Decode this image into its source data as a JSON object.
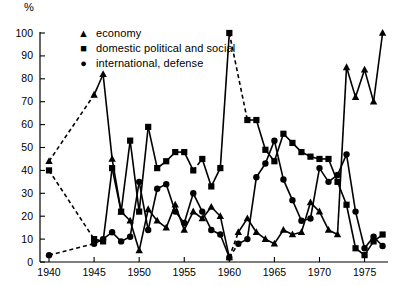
{
  "chart_data": {
    "type": "line",
    "title": "",
    "xlabel": "",
    "ylabel": "%",
    "ylim": [
      0,
      100
    ],
    "xlim": [
      1939,
      1977.6
    ],
    "grid": false,
    "legend_position": "top-left",
    "ytick_labels": [
      "0",
      "10",
      "20",
      "30",
      "40",
      "50",
      "60",
      "70",
      "80",
      "90",
      "100"
    ],
    "ytick_values": [
      0,
      10,
      20,
      30,
      40,
      50,
      60,
      70,
      80,
      90,
      100
    ],
    "xtick_labels": [
      "1940",
      "1945",
      "1950",
      "1955",
      "1960",
      "1965",
      "1970",
      "1975"
    ],
    "xtick_values": [
      1940,
      1945,
      1950,
      1955,
      1960,
      1965,
      1970,
      1975
    ],
    "series": [
      {
        "name": "economy",
        "marker": "triangle",
        "marker_glyph": "▲",
        "color": "#000000",
        "x": [
          1940,
          1945,
          1946,
          1947,
          1948,
          1949,
          1950,
          1951,
          1952,
          1953,
          1954,
          1955,
          1956,
          1957,
          1958,
          1959,
          1960,
          1961,
          1962,
          1963,
          1964,
          1965,
          1966,
          1967,
          1968,
          1969,
          1970,
          1971,
          1972,
          1973,
          1974,
          1975,
          1976,
          1977
        ],
        "y": [
          44,
          73,
          82,
          45,
          22,
          18,
          5,
          23,
          18,
          15,
          25,
          14,
          22,
          19,
          24,
          20,
          2,
          13,
          19,
          13,
          10,
          8,
          14,
          12,
          13,
          26,
          22,
          14,
          12,
          85,
          72,
          84,
          70,
          100
        ],
        "dashed_segments": [
          [
            1940,
            1945
          ],
          [
            1960,
            1961
          ]
        ]
      },
      {
        "name": "domestic political and social",
        "marker": "square",
        "marker_glyph": "■",
        "color": "#000000",
        "x": [
          1940,
          1945,
          1946,
          1947,
          1948,
          1949,
          1950,
          1951,
          1952,
          1953,
          1954,
          1955,
          1956,
          1957,
          1958,
          1959,
          1960,
          1962,
          1963,
          1964,
          1965,
          1966,
          1967,
          1968,
          1969,
          1970,
          1971,
          1972,
          1973,
          1974,
          1975,
          1976,
          1977
        ],
        "y": [
          40,
          10,
          9,
          41,
          22,
          53,
          22,
          59,
          41,
          44,
          48,
          48,
          40,
          45,
          33,
          41,
          100,
          62,
          62,
          49,
          44,
          56,
          52,
          48,
          46,
          45,
          45,
          35,
          25,
          6,
          3,
          9,
          12
        ],
        "dashed_segments": [
          [
            1940,
            1945
          ],
          [
            1956,
            1957
          ],
          [
            1960,
            1962
          ]
        ]
      },
      {
        "name": "international, defense",
        "marker": "circle",
        "marker_glyph": "●",
        "color": "#000000",
        "x": [
          1940,
          1945,
          1946,
          1947,
          1948,
          1949,
          1950,
          1951,
          1952,
          1953,
          1954,
          1955,
          1956,
          1957,
          1958,
          1959,
          1960,
          1961,
          1962,
          1963,
          1964,
          1965,
          1966,
          1967,
          1968,
          1969,
          1970,
          1971,
          1972,
          1973,
          1974,
          1975,
          1976,
          1977
        ],
        "y": [
          3,
          8,
          10,
          13,
          9,
          11,
          35,
          14,
          32,
          34,
          22,
          17,
          30,
          22,
          14,
          12,
          2,
          8,
          10,
          37,
          43,
          53,
          36,
          27,
          18,
          19,
          41,
          35,
          38,
          47,
          22,
          6,
          11,
          7
        ],
        "dashed_segments": [
          [
            1940,
            1945
          ],
          [
            1960,
            1961
          ]
        ]
      }
    ]
  },
  "axis": {
    "unit_label": "%"
  },
  "legend": {
    "items": [
      {
        "marker": "▲",
        "label": "economy",
        "icon": "triangle-marker-icon"
      },
      {
        "marker": "■",
        "label": "domestic political and social",
        "icon": "square-marker-icon"
      },
      {
        "marker": "●",
        "label": "international, defense",
        "icon": "circle-marker-icon"
      }
    ]
  }
}
